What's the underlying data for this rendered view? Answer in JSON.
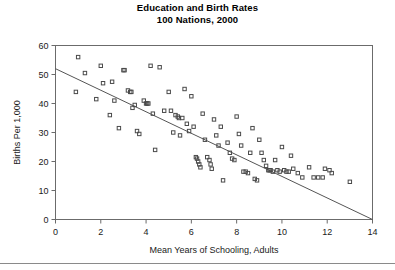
{
  "chart_data": {
    "type": "scatter",
    "title": "Education and Birth Rates",
    "subtitle": "100 Nations, 2000",
    "xlabel": "Mean Years of Schooling, Adults",
    "ylabel": "Births Per 1,000",
    "xlim": [
      0,
      14
    ],
    "ylim": [
      0,
      60
    ],
    "xticks": [
      0,
      2,
      4,
      6,
      8,
      10,
      12,
      14
    ],
    "yticks": [
      0,
      10,
      20,
      30,
      40,
      50,
      60
    ],
    "grid": false,
    "legend": null,
    "marker": "open-square",
    "marker_color": "#4a4a4a",
    "trendline": {
      "label": "linear fit",
      "x": [
        0,
        14
      ],
      "y": [
        52,
        0
      ],
      "color": "#555555"
    },
    "points": [
      {
        "x": 1.0,
        "y": 56.0
      },
      {
        "x": 0.9,
        "y": 44.0
      },
      {
        "x": 1.3,
        "y": 50.5
      },
      {
        "x": 1.8,
        "y": 41.5
      },
      {
        "x": 2.0,
        "y": 53.0
      },
      {
        "x": 2.1,
        "y": 47.0
      },
      {
        "x": 2.4,
        "y": 36.0
      },
      {
        "x": 2.5,
        "y": 47.5
      },
      {
        "x": 2.6,
        "y": 41.0
      },
      {
        "x": 2.8,
        "y": 31.5
      },
      {
        "x": 3.0,
        "y": 51.5
      },
      {
        "x": 3.05,
        "y": 51.5
      },
      {
        "x": 3.2,
        "y": 44.5
      },
      {
        "x": 3.3,
        "y": 44.0
      },
      {
        "x": 3.35,
        "y": 44.0
      },
      {
        "x": 3.4,
        "y": 38.5
      },
      {
        "x": 3.5,
        "y": 39.5
      },
      {
        "x": 3.6,
        "y": 30.5
      },
      {
        "x": 3.7,
        "y": 29.5
      },
      {
        "x": 3.9,
        "y": 41.0
      },
      {
        "x": 4.0,
        "y": 40.0
      },
      {
        "x": 4.05,
        "y": 40.0
      },
      {
        "x": 4.1,
        "y": 40.0
      },
      {
        "x": 4.2,
        "y": 53.0
      },
      {
        "x": 4.3,
        "y": 36.5
      },
      {
        "x": 4.4,
        "y": 24.0
      },
      {
        "x": 4.6,
        "y": 52.5
      },
      {
        "x": 4.8,
        "y": 37.5
      },
      {
        "x": 5.0,
        "y": 44.0
      },
      {
        "x": 5.1,
        "y": 37.5
      },
      {
        "x": 5.2,
        "y": 30.0
      },
      {
        "x": 5.3,
        "y": 36.0
      },
      {
        "x": 5.4,
        "y": 35.5
      },
      {
        "x": 5.45,
        "y": 35.0
      },
      {
        "x": 5.5,
        "y": 29.0
      },
      {
        "x": 5.6,
        "y": 35.0
      },
      {
        "x": 5.7,
        "y": 45.0
      },
      {
        "x": 5.8,
        "y": 33.0
      },
      {
        "x": 5.9,
        "y": 30.5
      },
      {
        "x": 6.0,
        "y": 42.5
      },
      {
        "x": 6.1,
        "y": 32.0
      },
      {
        "x": 6.2,
        "y": 21.5
      },
      {
        "x": 6.25,
        "y": 21.0
      },
      {
        "x": 6.3,
        "y": 20.0
      },
      {
        "x": 6.35,
        "y": 19.0
      },
      {
        "x": 6.4,
        "y": 18.0
      },
      {
        "x": 6.5,
        "y": 36.5
      },
      {
        "x": 6.6,
        "y": 27.5
      },
      {
        "x": 6.7,
        "y": 21.5
      },
      {
        "x": 6.8,
        "y": 20.5
      },
      {
        "x": 6.85,
        "y": 19.0
      },
      {
        "x": 6.9,
        "y": 17.5
      },
      {
        "x": 7.0,
        "y": 34.5
      },
      {
        "x": 7.1,
        "y": 29.0
      },
      {
        "x": 7.2,
        "y": 25.5
      },
      {
        "x": 7.3,
        "y": 32.0
      },
      {
        "x": 7.4,
        "y": 13.5
      },
      {
        "x": 7.6,
        "y": 26.5
      },
      {
        "x": 7.7,
        "y": 23.0
      },
      {
        "x": 7.8,
        "y": 21.0
      },
      {
        "x": 7.9,
        "y": 20.5
      },
      {
        "x": 8.0,
        "y": 35.5
      },
      {
        "x": 8.1,
        "y": 29.5
      },
      {
        "x": 8.2,
        "y": 25.5
      },
      {
        "x": 8.3,
        "y": 16.5
      },
      {
        "x": 8.4,
        "y": 16.5
      },
      {
        "x": 8.5,
        "y": 16.0
      },
      {
        "x": 8.6,
        "y": 23.0
      },
      {
        "x": 8.7,
        "y": 31.5
      },
      {
        "x": 8.8,
        "y": 14.0
      },
      {
        "x": 8.9,
        "y": 13.5
      },
      {
        "x": 9.0,
        "y": 27.5
      },
      {
        "x": 9.1,
        "y": 23.0
      },
      {
        "x": 9.2,
        "y": 20.5
      },
      {
        "x": 9.3,
        "y": 18.5
      },
      {
        "x": 9.4,
        "y": 17.0
      },
      {
        "x": 9.45,
        "y": 17.0
      },
      {
        "x": 9.5,
        "y": 17.0
      },
      {
        "x": 9.6,
        "y": 16.5
      },
      {
        "x": 9.7,
        "y": 20.5
      },
      {
        "x": 9.8,
        "y": 17.0
      },
      {
        "x": 9.9,
        "y": 16.5
      },
      {
        "x": 10.0,
        "y": 25.0
      },
      {
        "x": 10.1,
        "y": 17.0
      },
      {
        "x": 10.2,
        "y": 16.5
      },
      {
        "x": 10.3,
        "y": 16.5
      },
      {
        "x": 10.4,
        "y": 22.0
      },
      {
        "x": 10.5,
        "y": 17.5
      },
      {
        "x": 10.7,
        "y": 16.0
      },
      {
        "x": 10.9,
        "y": 14.5
      },
      {
        "x": 11.2,
        "y": 18.0
      },
      {
        "x": 11.4,
        "y": 14.5
      },
      {
        "x": 11.6,
        "y": 14.5
      },
      {
        "x": 11.8,
        "y": 14.5
      },
      {
        "x": 11.9,
        "y": 17.5
      },
      {
        "x": 12.1,
        "y": 17.0
      },
      {
        "x": 12.2,
        "y": 16.0
      },
      {
        "x": 13.0,
        "y": 13.0
      }
    ]
  }
}
